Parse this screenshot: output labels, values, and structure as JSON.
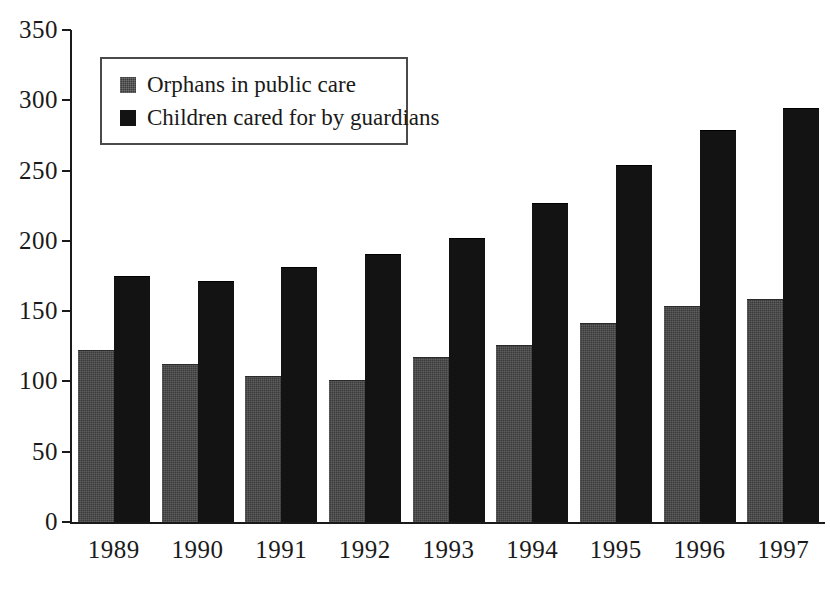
{
  "chart_data": {
    "type": "bar",
    "title": "",
    "subtitle": "",
    "xlabel": "",
    "ylabel": "",
    "categories": [
      "1989",
      "1990",
      "1991",
      "1992",
      "1993",
      "1994",
      "1995",
      "1996",
      "1997"
    ],
    "series": [
      {
        "name": "Orphans in public care",
        "color": "#3b3b3b",
        "values": [
          122,
          112,
          103,
          100,
          117,
          125,
          141,
          153,
          158
        ]
      },
      {
        "name": "Children cared for by guardians",
        "color": "#131313",
        "values": [
          174,
          171,
          181,
          190,
          201,
          226,
          253,
          278,
          294
        ]
      }
    ],
    "ylim": [
      0,
      350
    ],
    "ytick_labels": [
      "0",
      "50",
      "100",
      "150",
      "200",
      "250",
      "300",
      "350"
    ],
    "ytick_values": [
      0,
      50,
      100,
      150,
      200,
      250,
      300,
      350
    ],
    "grid": false,
    "legend_position": "upper-left-inside",
    "axis_color": "#1a1a1a",
    "background_color": "#ffffff"
  },
  "legend": {
    "entries": [
      {
        "label": "Orphans in public care",
        "swatch": "legend-swatch-gray"
      },
      {
        "label": "Children cared for by guardians",
        "swatch": "legend-swatch-black"
      }
    ]
  }
}
